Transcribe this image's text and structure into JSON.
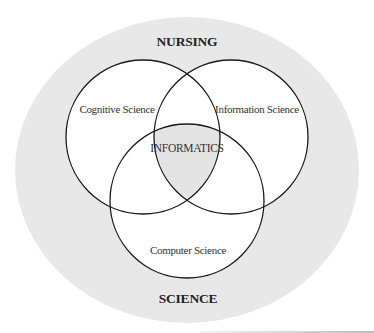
{
  "diagram": {
    "type": "venn",
    "outer_region": {
      "top_label": "NURSING",
      "bottom_label": "SCIENCE",
      "fill": "#e8e8e8"
    },
    "sets": [
      {
        "label": "Cognitive Science",
        "position": "top-left"
      },
      {
        "label": "Information Science",
        "position": "top-right"
      },
      {
        "label": "Computer Science",
        "position": "bottom"
      }
    ],
    "intersection": {
      "label": "INFORMATICS",
      "fill": "#e4e4e4"
    },
    "colors": {
      "circle_fill": "#ffffff",
      "stroke": "#1a1a1a",
      "text": "#333333"
    }
  }
}
